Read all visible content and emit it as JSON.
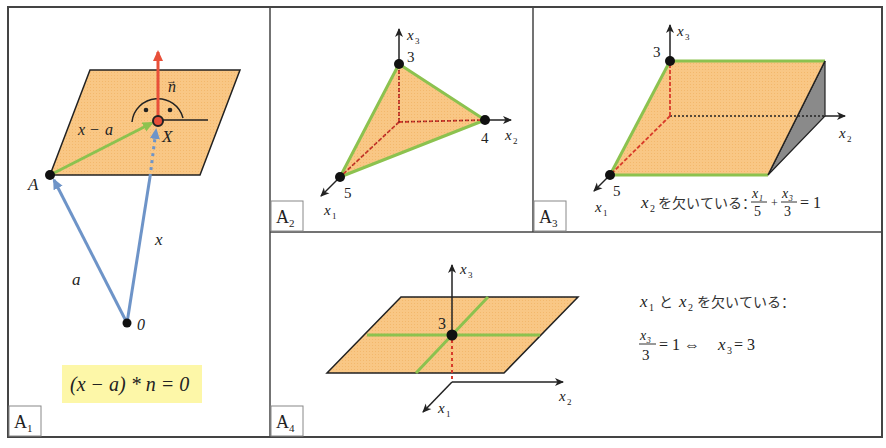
{
  "colors": {
    "plane_fill": "#f9c785",
    "plane_edge": "#222222",
    "trace_green": "#8cc24f",
    "normal_red": "#e8503a",
    "vector_blue": "#6e94c8",
    "dashed_red": "#d83a2a",
    "shadow_gray": "#8a8a8a",
    "formula_bg": "#fdf7a8",
    "frame": "#444444"
  },
  "panels": {
    "a1": {
      "tag": "A",
      "tag_sub": "1",
      "labels": {
        "n": "n",
        "x_minus_a_x": "x",
        "x_minus_a_minus": "−",
        "x_minus_a_a": "a",
        "X": "X",
        "A": "A",
        "a": "a",
        "x": "x",
        "origin": "0"
      },
      "formula": "(x − a) * n = 0"
    },
    "a2": {
      "tag": "A",
      "tag_sub": "2",
      "axes": {
        "x1": "x",
        "x1_sub": "1",
        "x2": "x",
        "x2_sub": "2",
        "x3": "x",
        "x3_sub": "3"
      },
      "intercepts": {
        "x1": "5",
        "x2": "4",
        "x3": "3"
      }
    },
    "a3": {
      "tag": "A",
      "tag_sub": "3",
      "axes": {
        "x1": "x",
        "x1_sub": "1",
        "x2": "x",
        "x2_sub": "2",
        "x3": "x",
        "x3_sub": "3"
      },
      "intercepts": {
        "x1": "5",
        "x3": "3"
      },
      "caption_var": "x",
      "caption_var_sub": "2",
      "caption_text": "を欠いている：",
      "eq": {
        "num1": "x₁",
        "den1": "5",
        "plus": "+",
        "num2": "x₃",
        "den2": "3",
        "rhs": "= 1"
      }
    },
    "a4": {
      "tag": "A",
      "tag_sub": "4",
      "axes": {
        "x1": "x",
        "x1_sub": "1",
        "x2": "x",
        "x2_sub": "2",
        "x3": "x",
        "x3_sub": "3"
      },
      "intercepts": {
        "x3": "3"
      },
      "caption_line1_v1": "x",
      "caption_line1_v1_sub": "1",
      "caption_line1_and": "と",
      "caption_line1_v2": "x",
      "caption_line1_v2_sub": "2",
      "caption_line1_text": "を欠いている：",
      "eq": {
        "num": "x₃",
        "den": "3",
        "rhs1": "= 1 ⇔",
        "var": "x",
        "var_sub": "3",
        "rhs2": "= 3"
      }
    }
  }
}
